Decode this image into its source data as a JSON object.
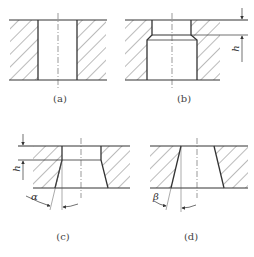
{
  "figures": [
    {
      "id": "a",
      "caption": "(a)",
      "description": "straight through hole"
    },
    {
      "id": "b",
      "caption": "(b)",
      "description": "hole with narrow land of height h and chamfered relief",
      "dimension_label": "h"
    },
    {
      "id": "c",
      "caption": "(c)",
      "description": "land of height h with tapered relief at angle alpha",
      "dimension_label": "h",
      "angle_label": "α"
    },
    {
      "id": "d",
      "caption": "(d)",
      "description": "fully tapered hole at angle beta",
      "angle_label": "β"
    }
  ],
  "colors": {
    "line": "#333333",
    "hatch": "#555555",
    "background": "#ffffff"
  }
}
